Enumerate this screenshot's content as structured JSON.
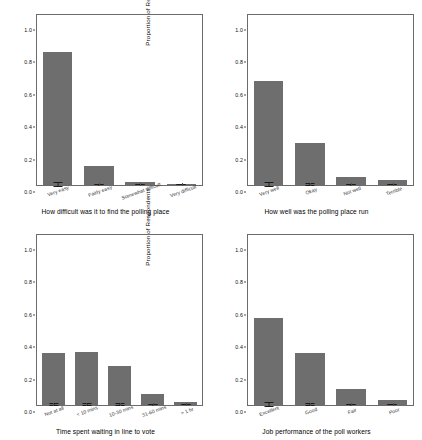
{
  "figure": {
    "background": "#ffffff",
    "bar_color": "#6e6e6e",
    "error_color": "#1a1a1a",
    "axis_color": "#6b6b6b",
    "width": 422,
    "height": 440
  },
  "chart_data": [
    {
      "type": "bar",
      "panel": "top-left",
      "title": "",
      "xlabel": "How difficult was it to find the polling place",
      "ylabel": "Proportion of Respondents",
      "categories": [
        "Very easy",
        "Fairly easy",
        "Somewhat difficult",
        "Very difficult"
      ],
      "values": [
        0.82,
        0.12,
        0.02,
        0.004
      ],
      "errors": [
        0.016,
        0.012,
        0.006,
        0.003
      ],
      "ylim": [
        0.0,
        1.05
      ],
      "yticks": [
        0.0,
        0.2,
        0.4,
        0.6,
        0.8,
        1.0
      ],
      "ytick_labels": [
        "0.0",
        "0.2",
        "0.4",
        "0.6",
        "0.8",
        "1.0"
      ],
      "grid": false,
      "legend": "none"
    },
    {
      "type": "bar",
      "panel": "top-right",
      "title": "",
      "xlabel": "How well was the polling place run",
      "ylabel": "Proportion of Respondents",
      "categories": [
        "Very well",
        "Okay",
        "Not well",
        "Terrible"
      ],
      "values": [
        0.64,
        0.26,
        0.05,
        0.03
      ],
      "errors": [
        0.022,
        0.02,
        0.009,
        0.008
      ],
      "ylim": [
        0.0,
        1.05
      ],
      "yticks": [
        0.0,
        0.2,
        0.4,
        0.6,
        0.8,
        1.0
      ],
      "ytick_labels": [
        "0.0",
        "0.2",
        "0.4",
        "0.6",
        "0.8",
        "1.0"
      ],
      "grid": false,
      "legend": "none"
    },
    {
      "type": "bar",
      "panel": "bottom-left",
      "title": "",
      "xlabel": "Time spent waiting in line to vote",
      "ylabel": "Proportion of Respondents",
      "categories": [
        "Not at all",
        "< 10 mins",
        "10-30 mins",
        "31-60 mins",
        "> 1 hr"
      ],
      "values": [
        0.32,
        0.33,
        0.24,
        0.07,
        0.02
      ],
      "errors": [
        0.022,
        0.023,
        0.02,
        0.012,
        0.006
      ],
      "ylim": [
        0.0,
        1.05
      ],
      "yticks": [
        0.0,
        0.2,
        0.4,
        0.6,
        0.8,
        1.0
      ],
      "ytick_labels": [
        "0.0",
        "0.2",
        "0.4",
        "0.6",
        "0.8",
        "1.0"
      ],
      "grid": false,
      "legend": "none"
    },
    {
      "type": "bar",
      "panel": "bottom-right",
      "title": "",
      "xlabel": "Job performance of the poll workers",
      "ylabel": "Proportion of Respondents",
      "categories": [
        "Excellent",
        "Good",
        "Fair",
        "Poor"
      ],
      "values": [
        0.54,
        0.32,
        0.1,
        0.03
      ],
      "errors": [
        0.023,
        0.021,
        0.013,
        0.007
      ],
      "ylim": [
        0.0,
        1.05
      ],
      "yticks": [
        0.0,
        0.2,
        0.4,
        0.6,
        0.8,
        1.0
      ],
      "ytick_labels": [
        "0.0",
        "0.2",
        "0.4",
        "0.6",
        "0.8",
        "1.0"
      ],
      "grid": false,
      "legend": "none"
    }
  ]
}
